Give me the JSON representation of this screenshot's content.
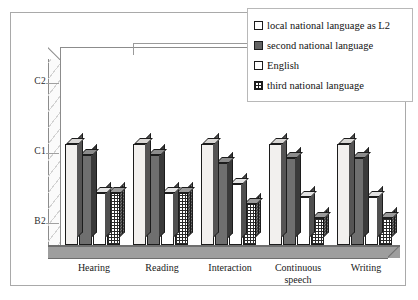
{
  "chart_data": {
    "type": "bar",
    "title": "",
    "subtitle": "",
    "xlabel": "",
    "ylabel": "",
    "grid": false,
    "legend_position": "top-right",
    "categories": [
      "Hearing",
      "Reading",
      "Interaction",
      "Continuous speech",
      "Writing"
    ],
    "ytick_labels": [
      "C2",
      "C1",
      "B2"
    ],
    "ylim": [
      "B2",
      "C2"
    ],
    "y_scale_note": "CEFR levels; ticks from bottom to top: B2, C1, C2",
    "series": [
      {
        "name": "local national language as L2",
        "swatch": "sw-light",
        "fill": "f-light",
        "values": [
          1.12,
          1.12,
          1.12,
          1.12,
          1.12
        ],
        "value_labels": [
          "C1+",
          "C1+",
          "C1+",
          "C1+",
          "C1+"
        ]
      },
      {
        "name": "second national language",
        "swatch": "sw-dark",
        "fill": "f-dark",
        "values": [
          0.96,
          0.96,
          0.85,
          0.92,
          0.92
        ],
        "value_labels": [
          "C1",
          "C1",
          "C1-",
          "C1",
          "C1"
        ]
      },
      {
        "name": "English",
        "swatch": "sw-white",
        "fill": "f-white",
        "values": [
          0.42,
          0.42,
          0.55,
          0.36,
          0.36
        ],
        "value_labels": [
          "B2+",
          "B2+",
          "B2+",
          "B2+",
          "B2+"
        ]
      },
      {
        "name": "third national language",
        "swatch": "sw-grid",
        "fill": "f-grid",
        "values": [
          0.42,
          0.42,
          0.26,
          0.06,
          0.06
        ],
        "value_labels": [
          "B2+",
          "B2+",
          "B2",
          "B2-",
          "B2-"
        ]
      }
    ]
  },
  "legend": {
    "items": [
      {
        "label": "local national language as L2",
        "swatch": "sw-light"
      },
      {
        "label": "second national language",
        "swatch": "sw-dark"
      },
      {
        "label": "English",
        "swatch": "sw-white"
      },
      {
        "label": "third national language",
        "swatch": "sw-grid"
      }
    ]
  },
  "axes": {
    "y_ticks": [
      "C2",
      "C1",
      "B2"
    ],
    "x_categories": [
      "Hearing",
      "Reading",
      "Interaction",
      "Continuous\nspeech",
      "Writing"
    ]
  },
  "colors": {
    "frame": "#a9a9a9",
    "axis": "#8c8c8c",
    "floor": "#9e9e9e",
    "bar_outline": "#1c1c1c",
    "fill_light": "#f2f0ee",
    "fill_dark": "#6f6f6f",
    "fill_white": "#ffffff",
    "fill_grid": "#ffffff",
    "text": "#1a1a1a",
    "background": "#ffffff"
  }
}
